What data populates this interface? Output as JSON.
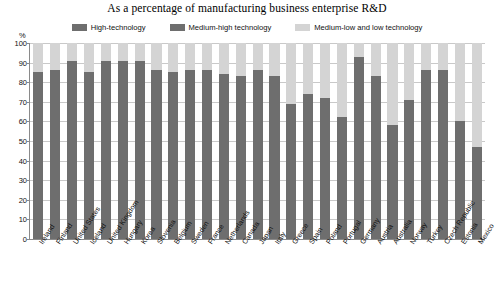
{
  "chart_data": {
    "type": "bar",
    "stacked": true,
    "title": "As a percentage of manufacturing business enterprise R&D",
    "xlabel": "",
    "ylabel": "%",
    "ylim": [
      0,
      100
    ],
    "yticks": [
      0,
      10,
      20,
      30,
      40,
      50,
      60,
      70,
      80,
      90,
      100
    ],
    "grid": true,
    "legend_position": "top",
    "categories": [
      "Ireland",
      "Finland",
      "United States",
      "Iceland",
      "United Kingdom",
      "Hungary",
      "Korea",
      "Slovenia",
      "Belgium",
      "Sweden",
      "France",
      "Netherlands",
      "Canada",
      "Japan",
      "Italy",
      "Greece",
      "Spain",
      "Poland",
      "Portugal",
      "Germany",
      "Austria",
      "Australia",
      "Norway",
      "Turkey",
      "Czech Republic",
      "Estonia",
      "Mexico"
    ],
    "series": [
      {
        "name": "High-technology",
        "color": "#6e6e6e",
        "values": [
          62,
          49,
          55,
          44,
          42,
          52,
          45,
          30,
          40,
          38,
          41,
          36,
          38,
          28,
          20,
          18,
          22,
          17,
          30,
          25,
          18,
          22,
          14,
          26,
          24,
          17,
          24
        ]
      },
      {
        "name": "Medium-high technology",
        "color": "#6e6e6e",
        "values": [
          23,
          37,
          36,
          41,
          49,
          39,
          46,
          56,
          45,
          48,
          45,
          48,
          45,
          58,
          63,
          51,
          52,
          55,
          32,
          68,
          65,
          36,
          57,
          60,
          62,
          43,
          23
        ]
      },
      {
        "name": "Medium-low and low technology",
        "color": "#d4d4d4",
        "values": [
          15,
          14,
          9,
          15,
          9,
          9,
          9,
          14,
          15,
          14,
          14,
          16,
          17,
          14,
          17,
          31,
          26,
          28,
          38,
          7,
          17,
          42,
          29,
          14,
          14,
          40,
          53
        ]
      }
    ],
    "dark_segment_tops": [
      85,
      86,
      91,
      85,
      91,
      91,
      91,
      86,
      85,
      86,
      86,
      84,
      83,
      86,
      83,
      69,
      74,
      72,
      62,
      93,
      83,
      58,
      71,
      86,
      86,
      60,
      47
    ]
  },
  "colors": {
    "high_tech": "#6e6e6e",
    "medium_high_tech": "#6e6e6e",
    "medium_low_low_tech": "#d4d4d4",
    "grid": "#c9c9c9",
    "axis": "#8a8a8a",
    "background": "#ffffff"
  }
}
